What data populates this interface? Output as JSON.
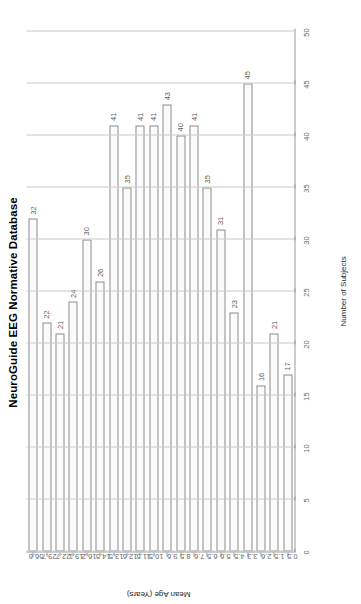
{
  "chart_data": {
    "type": "bar",
    "orientation": "horizontal",
    "title": "NeuroGuide EEG Normative Database",
    "xlabel": "Mean Age (Years)",
    "ylabel": "Number of Subjects",
    "categories": [
      "0.5",
      "1.5",
      "2.6",
      "3.3",
      "4.5",
      "5.6",
      "6.5",
      "7.6",
      "8.5",
      "9.6",
      "10.5",
      "11.5",
      "12.6",
      "13.5",
      "14.5",
      "16.2",
      "19.1",
      "22.7",
      "29.7",
      "56.6"
    ],
    "values": [
      17,
      21,
      16,
      45,
      23,
      31,
      35,
      41,
      40,
      43,
      41,
      41,
      35,
      41,
      26,
      30,
      24,
      21,
      22,
      32
    ],
    "value_labels": [
      "17",
      "21",
      "16",
      "45",
      "23",
      "31",
      "35",
      "41",
      "40",
      "43",
      "41",
      "41",
      "35",
      "41",
      "26",
      "30",
      "24",
      "21",
      "22",
      "32"
    ],
    "ylim": [
      0,
      50
    ],
    "yticks": [
      "0",
      "5",
      "10",
      "15",
      "20",
      "25",
      "30",
      "35",
      "40",
      "45",
      "50"
    ],
    "ytick_values": [
      0,
      5,
      10,
      15,
      20,
      25,
      30,
      35,
      40,
      45,
      50
    ],
    "grid": "vertical-only",
    "legend": "none",
    "bar_fill": "#fbfbfb",
    "bar_stroke": "#8c8c8c",
    "grid_color": "#c9c9c9",
    "axis_color": "#9a9a9a",
    "text_color": "#000000"
  }
}
